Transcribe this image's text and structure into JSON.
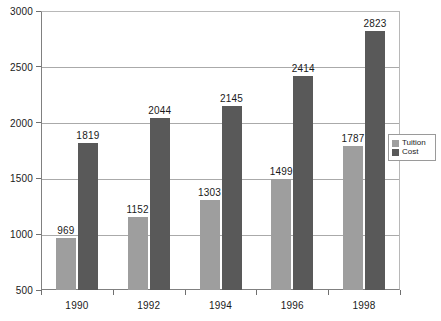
{
  "chart_data": {
    "type": "bar",
    "title": "",
    "xlabel": "",
    "ylabel": "",
    "categories": [
      "1990",
      "1992",
      "1994",
      "1996",
      "1998"
    ],
    "series": [
      {
        "name": "Tuition",
        "color": "#9e9e9e",
        "values": [
          969,
          1152,
          1303,
          1499,
          1787
        ]
      },
      {
        "name": "Cost",
        "color": "#595959",
        "values": [
          1819,
          2044,
          2145,
          2414,
          2823
        ]
      }
    ],
    "ylim": [
      500,
      3000
    ],
    "yticks": [
      500,
      1000,
      1500,
      2000,
      2500,
      3000
    ],
    "grid": true,
    "data_labels": true,
    "legend_position": "bottom-right-inside"
  },
  "legend": {
    "items": [
      {
        "label": "Tuition"
      },
      {
        "label": "Cost"
      }
    ]
  }
}
